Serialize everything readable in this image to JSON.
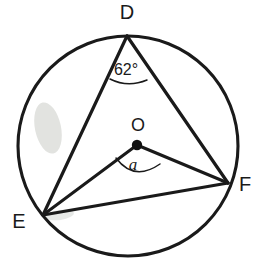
{
  "figure": {
    "type": "geometry-diagram",
    "width": 265,
    "height": 265,
    "background_color": "#ffffff",
    "stroke_color": "#1a1a1a"
  },
  "circle": {
    "name": "circumscribed-circle",
    "center_x": 128,
    "center_y": 146,
    "radius": 110,
    "stroke_width": 3.1
  },
  "center": {
    "label": "O",
    "dot_x": 137,
    "dot_y": 145,
    "dot_radius": 5.2,
    "label_x": 138,
    "label_y": 131
  },
  "vertices": [
    {
      "label": "D",
      "x": 127,
      "y": 36,
      "label_x": 127,
      "label_y": 19,
      "anchor": "middle"
    },
    {
      "label": "E",
      "x": 43,
      "y": 215,
      "label_x": 19,
      "label_y": 228,
      "anchor": "middle"
    },
    {
      "label": "F",
      "x": 228,
      "y": 183,
      "label_x": 245,
      "label_y": 191,
      "anchor": "middle"
    }
  ],
  "segments": [
    {
      "name": "chord-DE",
      "from": "D",
      "to": "E",
      "x1": 127,
      "y1": 36,
      "x2": 43,
      "y2": 215
    },
    {
      "name": "chord-DF",
      "from": "D",
      "to": "F",
      "x1": 127,
      "y1": 36,
      "x2": 228,
      "y2": 183
    },
    {
      "name": "chord-EF",
      "from": "E",
      "to": "F",
      "x1": 43,
      "y1": 215,
      "x2": 228,
      "y2": 183
    },
    {
      "name": "radius-OE",
      "from": "O",
      "to": "E",
      "x1": 137,
      "y1": 145,
      "x2": 43,
      "y2": 215
    },
    {
      "name": "radius-OF",
      "from": "O",
      "to": "F",
      "x1": 137,
      "y1": 145,
      "x2": 228,
      "y2": 183
    }
  ],
  "angles": [
    {
      "name": "inscribed-angle-at-D",
      "label": "62°",
      "value": 62,
      "unit": "degrees",
      "vertex": "D",
      "label_x": 126,
      "label_y": 75,
      "arc_path": "M 110 79 Q 128 88 147 80"
    },
    {
      "name": "central-angle-at-O",
      "label": "a",
      "value": null,
      "unit": "degrees",
      "vertex": "O",
      "label_x": 133,
      "label_y": 170,
      "arc_path": "M 116 158 Q 134 182 160 164"
    }
  ],
  "artifacts": [
    {
      "name": "scan-smudge-left",
      "cx": 48,
      "cy": 128,
      "rx": 13,
      "ry": 26,
      "rotation": -12
    },
    {
      "name": "scan-smudge-lower",
      "cx": 60,
      "cy": 215,
      "rx": 14,
      "ry": 5,
      "rotation": -8
    }
  ]
}
